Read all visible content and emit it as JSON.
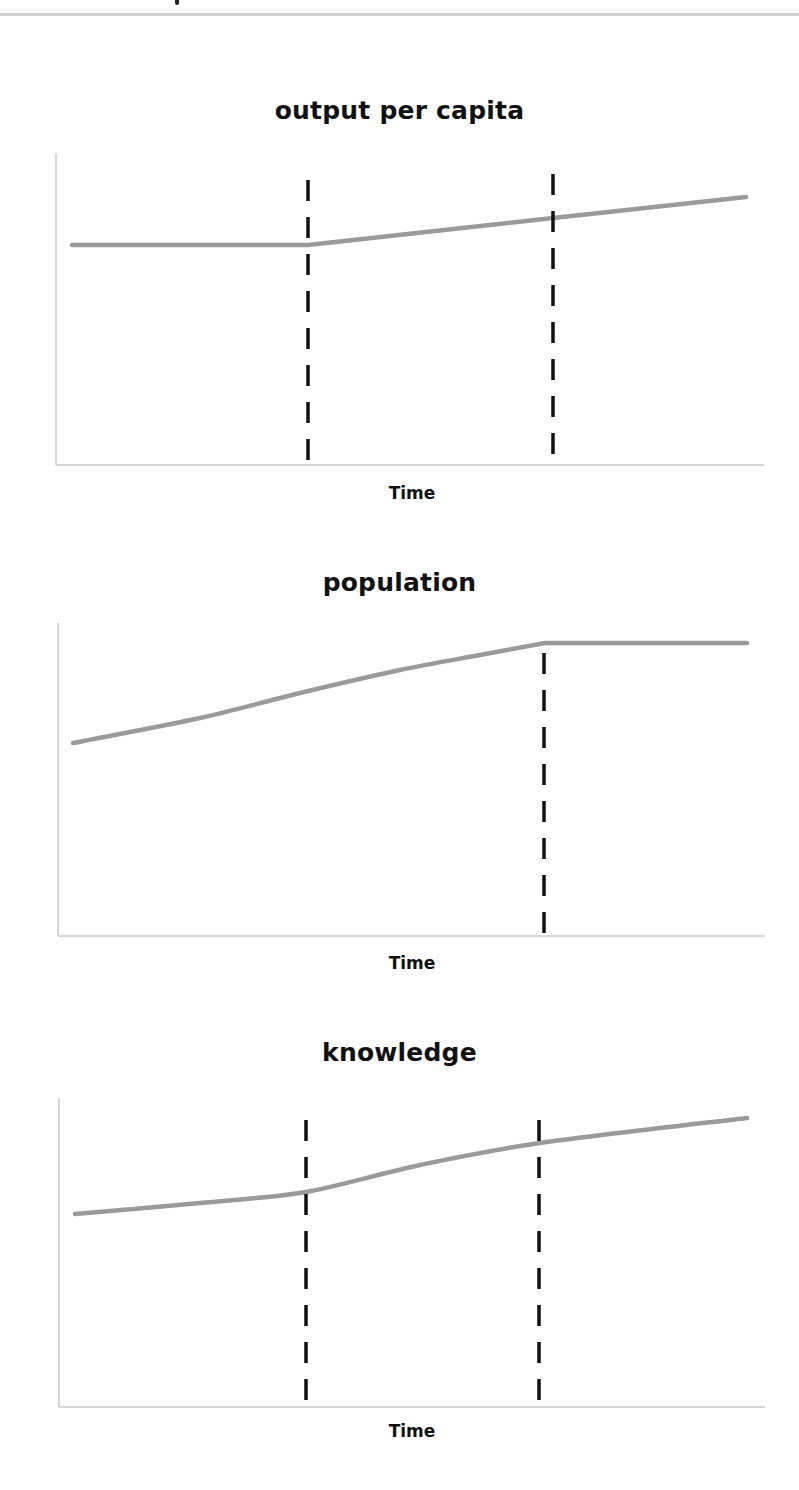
{
  "page": {
    "cutoff_header_text": ""
  },
  "chart_data": [
    {
      "type": "line",
      "title": "output per capita",
      "xlabel": "Time",
      "ylabel": "",
      "grid": false,
      "legend": null,
      "series": [
        {
          "name": "output per capita",
          "color": "#9a9a9a",
          "points_px": [
            [
              72,
              245
            ],
            [
              308,
              245
            ],
            [
              553,
              218
            ],
            [
              746,
              197
            ]
          ]
        }
      ],
      "vertical_markers": [
        {
          "style": "dashed",
          "x_px": 308,
          "y_top_px": 180,
          "y_bottom_px": 465
        },
        {
          "style": "dashed",
          "x_px": 553,
          "y_top_px": 174,
          "y_bottom_px": 462
        }
      ],
      "axes_px": {
        "x0": 56,
        "x1": 764,
        "y_top": 153,
        "y_bottom": 465
      },
      "description": "Flat (constant) until first marker, then rising with a positive slope that continues steadily after the second marker."
    },
    {
      "type": "line",
      "title": "population",
      "xlabel": "Time",
      "ylabel": "",
      "grid": false,
      "legend": null,
      "series": [
        {
          "name": "population",
          "color": "#9a9a9a",
          "points_px": [
            [
              73,
              743
            ],
            [
              200,
              718
            ],
            [
              300,
              693
            ],
            [
              400,
              670
            ],
            [
              480,
              655
            ],
            [
              545,
              643
            ],
            [
              747,
              643
            ]
          ]
        }
      ],
      "vertical_markers": [
        {
          "style": "dashed",
          "x_px": 544,
          "y_top_px": 653,
          "y_bottom_px": 936
        }
      ],
      "axes_px": {
        "x0": 58,
        "x1": 765,
        "y_top": 623,
        "y_bottom": 936
      },
      "description": "Rising at an accelerating rate until the marker, then flat afterwards."
    },
    {
      "type": "line",
      "title": "knowledge",
      "xlabel": "Time",
      "ylabel": "",
      "grid": false,
      "legend": null,
      "series": [
        {
          "name": "knowledge",
          "color": "#9a9a9a",
          "points_px": [
            [
              75,
              1214
            ],
            [
              200,
              1203
            ],
            [
              306,
              1192
            ],
            [
              420,
              1165
            ],
            [
              540,
              1143
            ],
            [
              747,
              1118
            ]
          ]
        }
      ],
      "vertical_markers": [
        {
          "style": "dashed",
          "x_px": 306,
          "y_top_px": 1120,
          "y_bottom_px": 1405
        },
        {
          "style": "dashed",
          "x_px": 539,
          "y_top_px": 1120,
          "y_bottom_px": 1402
        }
      ],
      "axes_px": {
        "x0": 59,
        "x1": 765,
        "y_top": 1098,
        "y_bottom": 1407
      },
      "description": "Slow growth, faster growth between the two markers, then moderate growth afterward."
    }
  ]
}
